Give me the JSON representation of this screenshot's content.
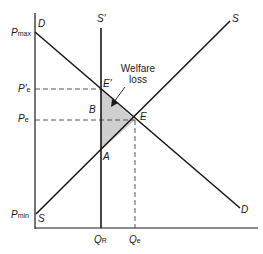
{
  "diagram": {
    "type": "supply-demand deadweight loss",
    "colors": {
      "line": "#1a1a1a",
      "shade": "#cfcfcf",
      "dash": "#444444"
    },
    "curves": {
      "demand_top": "D",
      "demand_bottom": "D",
      "supply_top": "S",
      "supply_bottom": "S",
      "restricted_supply": "S′"
    },
    "points": {
      "e_prime": "E′",
      "e": "E",
      "a": "A",
      "b": "B"
    },
    "y_axis": {
      "pmax": {
        "main": "P",
        "sub": "max"
      },
      "pe_prime": {
        "main": "P′",
        "sub": "e"
      },
      "pe": {
        "main": "P",
        "sub": "e"
      },
      "pmin": {
        "main": "P",
        "sub": "min"
      }
    },
    "x_axis": {
      "qr": {
        "main": "Q",
        "sub": "R"
      },
      "qe": {
        "main": "Q",
        "sub": "e"
      }
    },
    "annotation": {
      "line1": "Welfare",
      "line2": "loss"
    }
  }
}
